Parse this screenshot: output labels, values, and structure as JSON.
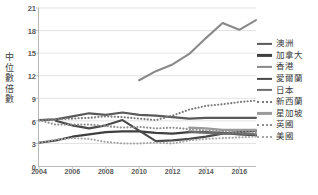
{
  "chart_data": {
    "type": "line",
    "title": "",
    "xlabel": "",
    "ylabel": "中位數倍數",
    "ylim": [
      0,
      21
    ],
    "ytick_values": [
      0,
      3,
      6,
      9,
      12,
      15,
      18,
      21
    ],
    "xlim": [
      2004,
      2017
    ],
    "x": [
      2004,
      2005,
      2006,
      2007,
      2008,
      2009,
      2010,
      2011,
      2012,
      2013,
      2014,
      2015,
      2016,
      2017
    ],
    "xtick_labels": [
      "2004",
      "2006",
      "2008",
      "2010",
      "2012",
      "2014",
      "2016"
    ],
    "xtick_values": [
      2004,
      2006,
      2008,
      2010,
      2012,
      2014,
      2016
    ],
    "grid": "horizontal",
    "legend_position": "right",
    "series": [
      {
        "name": "澳洲",
        "style": "solid",
        "color": "#595959",
        "width": 2.1,
        "values": [
          6.1,
          6.2,
          6.6,
          7.0,
          6.8,
          7.1,
          6.8,
          6.7,
          6.5,
          6.3,
          6.4,
          6.4,
          6.4,
          6.4
        ]
      },
      {
        "name": "加拿大",
        "style": "solid",
        "color": "#3f3f3f",
        "width": 2.1,
        "values": [
          3.1,
          3.4,
          3.9,
          4.2,
          4.5,
          4.6,
          4.6,
          4.4,
          4.3,
          4.5,
          4.5,
          4.4,
          4.2,
          4.1
        ]
      },
      {
        "name": "香港",
        "style": "solid",
        "color": "#8a8a8a",
        "width": 2.1,
        "values": [
          null,
          null,
          null,
          null,
          null,
          null,
          11.4,
          12.6,
          13.5,
          14.9,
          17.0,
          19.0,
          18.1,
          19.4
        ]
      },
      {
        "name": "愛爾蘭",
        "style": "solid",
        "color": "#4a4a4a",
        "width": 2.1,
        "values": [
          null,
          6.0,
          5.4,
          5.0,
          5.4,
          6.1,
          4.7,
          3.3,
          3.4,
          3.6,
          3.9,
          4.3,
          4.5,
          4.7
        ]
      },
      {
        "name": "日本",
        "style": "solid",
        "color": "#6e6e6e",
        "width": 2.1,
        "values": [
          null,
          null,
          null,
          null,
          null,
          null,
          null,
          null,
          null,
          4.6,
          4.4,
          4.3,
          4.3,
          4.2
        ]
      },
      {
        "name": "新西蘭",
        "style": "dotted",
        "color": "#7a7a7a",
        "width": 2.1,
        "values": [
          6.1,
          6.2,
          6.3,
          6.4,
          6.6,
          6.5,
          6.3,
          6.1,
          6.7,
          7.5,
          8.0,
          8.2,
          8.5,
          8.7
        ]
      },
      {
        "name": "星加坡",
        "style": "solid",
        "color": "#9a9a9a",
        "width": 2.1,
        "values": [
          null,
          null,
          null,
          null,
          null,
          null,
          null,
          null,
          null,
          5.1,
          5.0,
          4.8,
          4.8,
          4.8
        ]
      },
      {
        "name": "英國",
        "style": "dotted",
        "color": "#8f8f8f",
        "width": 2.1,
        "values": [
          6.1,
          5.5,
          5.5,
          5.5,
          5.3,
          5.1,
          5.2,
          5.0,
          5.1,
          4.9,
          4.7,
          4.6,
          4.5,
          4.5
        ]
      },
      {
        "name": "美國",
        "style": "dotted",
        "color": "#a5a5a5",
        "width": 2.1,
        "values": [
          3.1,
          3.5,
          3.7,
          3.6,
          3.2,
          3.0,
          3.0,
          3.1,
          3.0,
          3.4,
          3.6,
          3.7,
          3.8,
          3.9
        ]
      }
    ]
  },
  "legend": {
    "items": [
      {
        "label": "澳洲"
      },
      {
        "label": "加拿大"
      },
      {
        "label": "香港"
      },
      {
        "label": "愛爾蘭"
      },
      {
        "label": "日本"
      },
      {
        "label": "新西蘭"
      },
      {
        "label": "星加坡"
      },
      {
        "label": "英國"
      },
      {
        "label": "美國"
      }
    ]
  }
}
